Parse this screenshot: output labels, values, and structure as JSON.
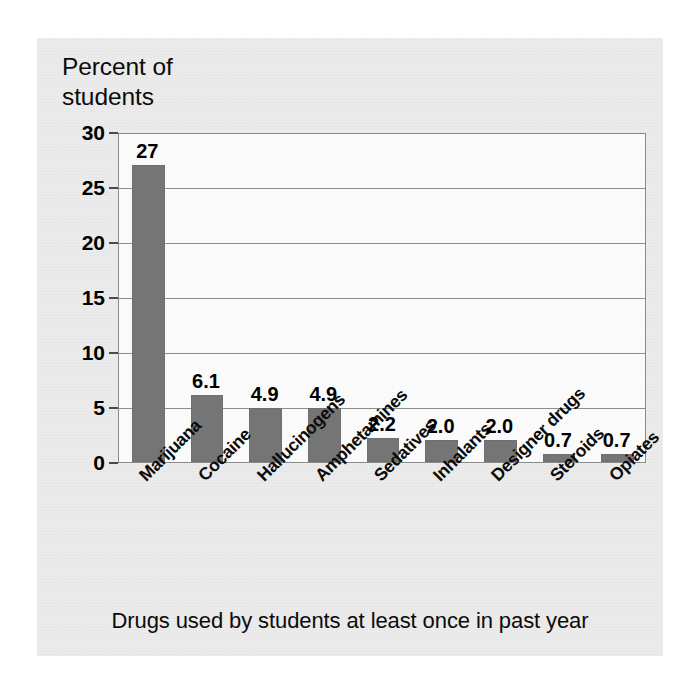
{
  "figure": {
    "axis_title": "Percent of\nstudents",
    "caption": "Drugs used by students at least once in past year",
    "background_color": "#e9e9e9",
    "plot_background_color": "#fafafa",
    "bar_color": "#757575",
    "grid_color": "#8d8d8d"
  },
  "chart_data": {
    "type": "bar",
    "title": "",
    "subtitle": "",
    "xlabel": "Drugs used by students at least once in past year",
    "ylabel": "Percent of students",
    "categories": [
      "Marijuana",
      "Cocaine",
      "Hallucinogens",
      "Amphetamines",
      "Sedatives",
      "Inhalants",
      "Designer drugs",
      "Steroids",
      "Opiates"
    ],
    "values": [
      27,
      6.1,
      4.9,
      4.9,
      2.2,
      2.0,
      2.0,
      0.7,
      0.7
    ],
    "value_labels": [
      "27",
      "6.1",
      "4.9",
      "4.9",
      "2.2",
      "2.0",
      "2.0",
      "0.7",
      "0.7"
    ],
    "ylim": [
      0,
      30
    ],
    "yticks": [
      0,
      5,
      10,
      15,
      20,
      25,
      30
    ],
    "ytick_labels": [
      "0",
      "5",
      "10",
      "15",
      "20",
      "25",
      "30"
    ],
    "grid": true,
    "grid_axis": "y",
    "legend": false,
    "legend_position": "none",
    "bar_color": "#757575",
    "xtick_rotation": 45
  }
}
